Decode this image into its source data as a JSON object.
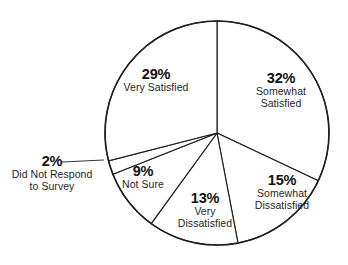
{
  "chart_data": {
    "type": "pie",
    "title": "",
    "subtitle": "",
    "xlabel": "",
    "ylabel": "",
    "grid": false,
    "legend_position": "none",
    "units": "percent",
    "start_angle_deg": 0,
    "direction": "clockwise",
    "categories": [
      "Somewhat Satisfied",
      "Somewhat Dissatisfied",
      "Very Dissatisfied",
      "Not Sure",
      "Did Not Respond to Survey",
      "Very Satisfied"
    ],
    "values": [
      32,
      15,
      13,
      9,
      2,
      29
    ],
    "slices": [
      {
        "label": "Somewhat Satisfied",
        "value": 32,
        "pct_text": "32%",
        "label_line_1": "Somewhat",
        "label_line_2": "Satisfied",
        "start_deg": 0,
        "end_deg": 115.2,
        "fill": "#ffffff",
        "stroke": "#1f1f1f",
        "callout": false
      },
      {
        "label": "Somewhat Dissatisfied",
        "value": 15,
        "pct_text": "15%",
        "label_line_1": "Somewhat",
        "label_line_2": "Dissatisfied",
        "start_deg": 115.2,
        "end_deg": 169.2,
        "fill": "#ffffff",
        "stroke": "#1f1f1f",
        "callout": false
      },
      {
        "label": "Very Dissatisfied",
        "value": 13,
        "pct_text": "13%",
        "label_line_1": "Very",
        "label_line_2": "Dissatisfied",
        "start_deg": 169.2,
        "end_deg": 216.0,
        "fill": "#ffffff",
        "stroke": "#1f1f1f",
        "callout": false
      },
      {
        "label": "Not Sure",
        "value": 9,
        "pct_text": "9%",
        "label_line_1": "Not Sure",
        "label_line_2": "",
        "start_deg": 216.0,
        "end_deg": 248.4,
        "fill": "#ffffff",
        "stroke": "#1f1f1f",
        "callout": false
      },
      {
        "label": "Did Not Respond to Survey",
        "value": 2,
        "pct_text": "2%",
        "label_line_1": "Did Not Respond",
        "label_line_2": "to Survey",
        "start_deg": 248.4,
        "end_deg": 255.6,
        "fill": "#ffffff",
        "stroke": "#1f1f1f",
        "callout": true
      },
      {
        "label": "Very Satisfied",
        "value": 29,
        "pct_text": "29%",
        "label_line_1": "Very Satisfied",
        "label_line_2": "",
        "start_deg": 255.6,
        "end_deg": 360.0,
        "fill": "#ffffff",
        "stroke": "#1f1f1f",
        "callout": false
      }
    ],
    "total": 100,
    "colors": {
      "background": "#ffffff",
      "outline": "#1f1f1f",
      "text": "#1a1a1a",
      "leader_line": "#1f1f1f"
    }
  },
  "labels": {
    "very_satisfied": {
      "pct": "29%",
      "line1": "Very Satisfied",
      "line2": ""
    },
    "somewhat_satisfied": {
      "pct": "32%",
      "line1": "Somewhat",
      "line2": "Satisfied"
    },
    "somewhat_dissat": {
      "pct": "15%",
      "line1": "Somewhat",
      "line2": "Dissatisfied"
    },
    "very_dissat": {
      "pct": "13%",
      "line1": "Very",
      "line2": "Dissatisfied"
    },
    "not_sure": {
      "pct": "9%",
      "line1": "Not Sure",
      "line2": ""
    },
    "no_response": {
      "pct": "2%",
      "line1": "Did Not Respond",
      "line2": "to Survey"
    }
  }
}
